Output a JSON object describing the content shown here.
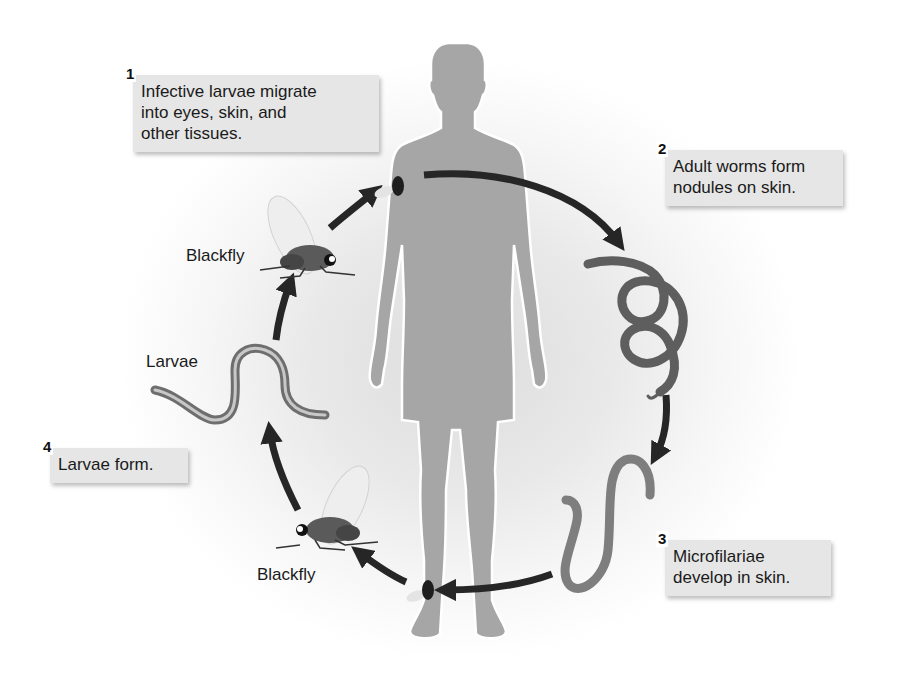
{
  "diagram": {
    "type": "life-cycle",
    "steps": [
      {
        "number": "1",
        "text": "Infective larvae migrate into eyes, skin, and other tissues.",
        "lines": [
          "Infective larvae migrate",
          "into eyes, skin, and",
          "other tissues."
        ]
      },
      {
        "number": "2",
        "text": "Adult worms form nodules on skin.",
        "lines": [
          "Adult worms form",
          "nodules on skin."
        ]
      },
      {
        "number": "3",
        "text": "Microfilariae develop in skin.",
        "lines": [
          "Microfilariae",
          "develop in skin."
        ]
      },
      {
        "number": "4",
        "text": "Larvae form.",
        "lines": [
          "Larvae form."
        ]
      }
    ],
    "labels": {
      "blackfly_top": "Blackfly",
      "larvae": "Larvae",
      "blackfly_bottom": "Blackfly"
    },
    "nodes": [
      {
        "id": "human",
        "label": "Human host (silhouette)"
      },
      {
        "id": "adult-worms",
        "label": "Adult worms (coiled)"
      },
      {
        "id": "microfilariae",
        "label": "Microfilariae"
      },
      {
        "id": "blackfly-bottom",
        "label": "Blackfly"
      },
      {
        "id": "larvae",
        "label": "Larvae"
      },
      {
        "id": "blackfly-top",
        "label": "Blackfly"
      }
    ],
    "edges": [
      {
        "from": "human",
        "to": "adult-worms"
      },
      {
        "from": "adult-worms",
        "to": "microfilariae"
      },
      {
        "from": "microfilariae",
        "to": "blackfly-bottom",
        "via": "blackfly biting ankle"
      },
      {
        "from": "blackfly-bottom",
        "to": "larvae"
      },
      {
        "from": "larvae",
        "to": "blackfly-top"
      },
      {
        "from": "blackfly-top",
        "to": "human",
        "via": "blackfly biting shoulder"
      }
    ],
    "colors": {
      "silhouette": "#a6a6a6",
      "arrow": "#262626",
      "worm_dark": "#5e5e5e",
      "worm_light": "#8a8a8a",
      "callout_bg": "#e6e6e6",
      "text": "#1a1a1a"
    }
  }
}
